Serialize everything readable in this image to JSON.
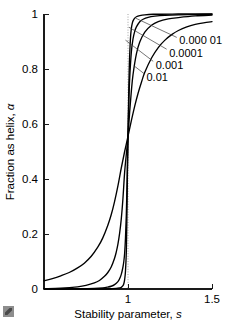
{
  "figure": {
    "background_color": "#ffffff",
    "ink_color": "#000000",
    "reference_line_color": "#9a9a9a",
    "corner_mark": "page-corner-artifact"
  },
  "chart_data": {
    "type": "line",
    "title": "",
    "xlabel_text": "Stability parameter,",
    "xlabel_symbol": "s",
    "ylabel_text": "Fraction as helix,",
    "ylabel_symbol": "α",
    "xlim": [
      0.5,
      1.5
    ],
    "ylim": [
      0,
      1
    ],
    "xticks": [
      1,
      1.5
    ],
    "xtick_labels": [
      "1",
      "1.5"
    ],
    "yticks": [
      0,
      0.2,
      0.4,
      0.6,
      0.8,
      1
    ],
    "ytick_labels": [
      "0",
      "0.2",
      "0.4",
      "0.6",
      "0.8",
      "1"
    ],
    "grid": false,
    "legend_position": "inline-labels-right",
    "annotations": [
      {
        "text": "s = 1 reference",
        "x": 1,
        "style": "dotted-vertical"
      }
    ],
    "series": [
      {
        "name": "0.000 01",
        "sigma": 1e-05,
        "label": "0.000 01",
        "label_x": 1.305,
        "label_y": 0.905,
        "leader_from": [
          1.29,
          0.915
        ],
        "leader_to": [
          1.045,
          0.985
        ],
        "x": [
          0.5,
          0.6,
          0.7,
          0.8,
          0.85,
          0.9,
          0.93,
          0.95,
          0.96,
          0.97,
          0.975,
          0.98,
          0.985,
          0.99,
          0.993,
          0.996,
          1.0,
          1.004,
          1.007,
          1.01,
          1.015,
          1.02,
          1.025,
          1.03,
          1.04,
          1.05,
          1.07,
          1.1,
          1.15,
          1.2,
          1.3,
          1.4,
          1.5
        ],
        "y": [
          0.0,
          0.0,
          0.0,
          0.0,
          0.0,
          0.001,
          0.002,
          0.004,
          0.006,
          0.012,
          0.019,
          0.034,
          0.065,
          0.135,
          0.24,
          0.4,
          0.56,
          0.7,
          0.79,
          0.85,
          0.915,
          0.948,
          0.965,
          0.975,
          0.985,
          0.99,
          0.994,
          0.997,
          0.999,
          0.999,
          1.0,
          1.0,
          1.0
        ]
      },
      {
        "name": "0.0001",
        "sigma": 0.0001,
        "label": "0.0001",
        "label_x": 1.245,
        "label_y": 0.86,
        "leader_from": [
          1.23,
          0.872
        ],
        "leader_to": [
          1.005,
          0.952
        ],
        "x": [
          0.5,
          0.6,
          0.7,
          0.8,
          0.85,
          0.88,
          0.9,
          0.92,
          0.94,
          0.95,
          0.96,
          0.97,
          0.975,
          0.98,
          0.985,
          0.99,
          0.995,
          1.0,
          1.005,
          1.01,
          1.02,
          1.03,
          1.04,
          1.05,
          1.07,
          1.09,
          1.12,
          1.16,
          1.22,
          1.3,
          1.4,
          1.5
        ],
        "y": [
          0.0,
          0.0,
          0.001,
          0.002,
          0.004,
          0.007,
          0.01,
          0.016,
          0.027,
          0.037,
          0.053,
          0.08,
          0.1,
          0.13,
          0.185,
          0.27,
          0.4,
          0.555,
          0.68,
          0.765,
          0.862,
          0.91,
          0.937,
          0.953,
          0.972,
          0.981,
          0.988,
          0.992,
          0.995,
          0.997,
          0.998,
          0.999
        ]
      },
      {
        "name": "0.001",
        "sigma": 0.001,
        "label": "0.001",
        "label_x": 1.165,
        "label_y": 0.815,
        "leader_from": [
          1.15,
          0.828
        ],
        "leader_to": [
          0.985,
          0.905
        ],
        "x": [
          0.5,
          0.6,
          0.7,
          0.75,
          0.8,
          0.83,
          0.86,
          0.88,
          0.9,
          0.92,
          0.93,
          0.94,
          0.95,
          0.96,
          0.97,
          0.98,
          0.99,
          1.0,
          1.01,
          1.02,
          1.03,
          1.05,
          1.07,
          1.1,
          1.14,
          1.18,
          1.24,
          1.3,
          1.4,
          1.5
        ],
        "y": [
          0.001,
          0.003,
          0.008,
          0.013,
          0.022,
          0.031,
          0.046,
          0.06,
          0.08,
          0.112,
          0.134,
          0.163,
          0.202,
          0.255,
          0.33,
          0.425,
          0.49,
          0.555,
          0.645,
          0.72,
          0.78,
          0.855,
          0.898,
          0.934,
          0.959,
          0.972,
          0.982,
          0.987,
          0.993,
          0.996
        ]
      },
      {
        "name": "0.01",
        "sigma": 0.01,
        "label": "0.01",
        "label_x": 1.11,
        "label_y": 0.77,
        "leader_from": [
          1.098,
          0.782
        ],
        "leader_to": [
          1.035,
          0.812
        ],
        "x": [
          0.5,
          0.55,
          0.6,
          0.65,
          0.7,
          0.74,
          0.78,
          0.82,
          0.85,
          0.88,
          0.9,
          0.92,
          0.94,
          0.96,
          0.98,
          1.0,
          1.02,
          1.04,
          1.06,
          1.08,
          1.1,
          1.14,
          1.18,
          1.22,
          1.26,
          1.3,
          1.35,
          1.4,
          1.45,
          1.5
        ],
        "y": [
          0.03,
          0.038,
          0.048,
          0.06,
          0.077,
          0.094,
          0.118,
          0.152,
          0.186,
          0.232,
          0.27,
          0.318,
          0.375,
          0.44,
          0.5,
          0.555,
          0.612,
          0.665,
          0.712,
          0.752,
          0.788,
          0.84,
          0.878,
          0.905,
          0.925,
          0.94,
          0.953,
          0.962,
          0.968,
          0.972
        ]
      }
    ]
  }
}
